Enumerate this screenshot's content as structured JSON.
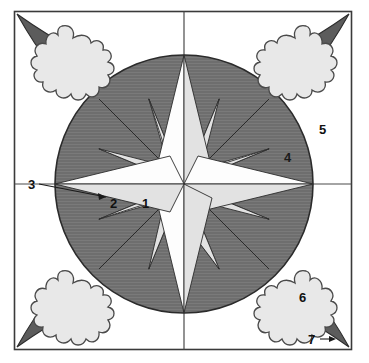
{
  "figure": {
    "frame": {
      "x": 14,
      "y": 11,
      "width": 338,
      "height": 339
    },
    "crosshair": {
      "cx": 184,
      "cy": 184
    },
    "circle": {
      "cx": 184,
      "cy": 184,
      "r": 129
    }
  },
  "colors": {
    "background": "#ffffff",
    "frame_stroke": "#3a3a3a",
    "circle_fill": "#6e6e6e",
    "circle_stroke": "#2b2b2b",
    "ray_light": "#fdfdfd",
    "ray_shaded": "#e2e2e2",
    "ray_stroke": "#2b2b2b",
    "blob_fill": "#e8e8e8",
    "blob_stroke": "#4a4a4a",
    "tail_fill": "#5c5c5c",
    "tail_stroke": "#2b2b2b",
    "label_color": "#111111",
    "leader_stroke": "#1a1a1a"
  },
  "labels": [
    {
      "id": "1",
      "text": "1",
      "x": 142,
      "y": 204,
      "note": "cardinal-south-ray"
    },
    {
      "id": "2",
      "text": "2",
      "x": 112,
      "y": 204,
      "note": "ordinal-southwest-ray"
    },
    {
      "id": "3",
      "text": "3",
      "x": 29,
      "y": 188,
      "note": "west-ray-leader"
    },
    {
      "id": "4",
      "text": "4",
      "x": 285,
      "y": 159,
      "note": "circle-field"
    },
    {
      "id": "5",
      "text": "5",
      "x": 320,
      "y": 131,
      "note": "outer-field"
    },
    {
      "id": "6",
      "text": "6",
      "x": 300,
      "y": 298,
      "note": "blob-body"
    },
    {
      "id": "7",
      "text": "7",
      "x": 311,
      "y": 343,
      "note": "blob-tail-leader"
    }
  ],
  "leaders": [
    {
      "id": "leader-3",
      "from": [
        39,
        184
      ],
      "to": [
        106,
        198
      ]
    },
    {
      "id": "leader-7",
      "from": [
        320,
        339
      ],
      "to": [
        334,
        339
      ]
    }
  ],
  "blobs": [
    {
      "id": "blob-top-left",
      "cx": 62,
      "cy": 58,
      "tail_to": [
        17,
        14
      ]
    },
    {
      "id": "blob-top-right",
      "cx": 306,
      "cy": 58,
      "tail_to": [
        349,
        14
      ]
    },
    {
      "id": "blob-bottom-left",
      "cx": 62,
      "cy": 303,
      "tail_to": [
        17,
        347
      ]
    },
    {
      "id": "blob-bottom-right",
      "cx": 306,
      "cy": 303,
      "tail_to": [
        349,
        347
      ]
    }
  ],
  "rose": {
    "points": 16,
    "center": [
      184,
      184
    ],
    "cardinal_length": 129,
    "ordinal_length": 120,
    "secondary_length": 92,
    "inner_radius_cardinal": 34,
    "inner_radius_ordinal": 30,
    "inner_radius_secondary": 20,
    "directions_deg": [
      0,
      22.5,
      45,
      67.5,
      90,
      112.5,
      135,
      157.5,
      180,
      202.5,
      225,
      247.5,
      270,
      292.5,
      315,
      337.5
    ]
  }
}
